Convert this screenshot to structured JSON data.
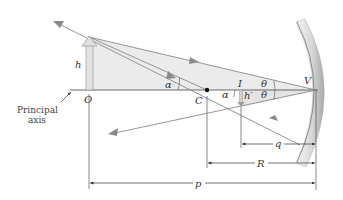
{
  "diagram": {
    "type": "concave-mirror-ray-diagram",
    "labels": {
      "object_height": "h",
      "object_point": "O",
      "center_of_curvature": "C",
      "image_point": "I",
      "image_height": "h′",
      "vertex": "V",
      "angle_alpha_1": "α",
      "angle_alpha_2": "α",
      "angle_theta_1": "θ",
      "angle_theta_2": "θ",
      "principal_axis_line1": "Principal",
      "principal_axis_line2": "axis",
      "image_distance": "q",
      "radius": "R",
      "object_distance": "p"
    },
    "colors": {
      "background": "#ffffff",
      "shade_fill": "#ebebeb",
      "ray": "#8a8a8a",
      "axis": "#555555",
      "object_arrow_fill": "#e2e2e2",
      "object_arrow_stroke": "#9a9a9a",
      "mirror_light": "#f2f2f2",
      "mirror_dark": "#9c9c9c",
      "dot": "#111111"
    }
  }
}
